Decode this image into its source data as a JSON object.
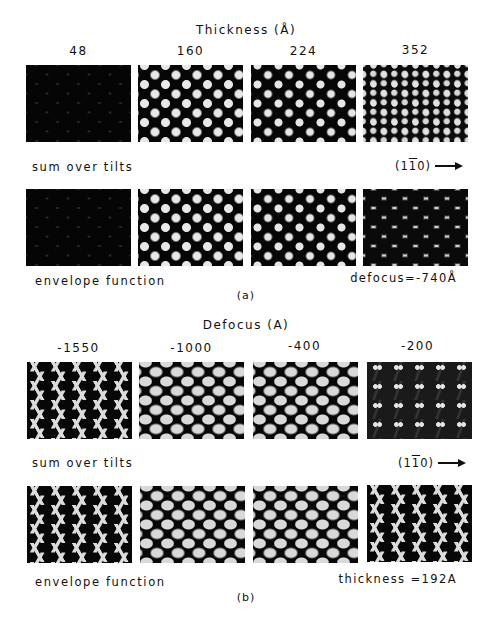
{
  "figure_a": {
    "title": "Thickness (Å)",
    "columns": [
      "48",
      "160",
      "224",
      "352"
    ],
    "row1_label": "sum over tilts",
    "row2_label": "envelope function",
    "orientation": {
      "prefix": "(1",
      "barred": "1",
      "suffix": "0)"
    },
    "parameter": "defocus=-740Å",
    "sublabel": "(a)",
    "row1_patterns": [
      "p-hexdark",
      "p-dots",
      "p-dots-small",
      "p-dense"
    ],
    "row2_patterns": [
      "p-hexdark",
      "p-dots",
      "p-dots-small",
      "p-hexmid"
    ]
  },
  "figure_b": {
    "title": "Defocus (A)",
    "columns": [
      "-1550",
      "-1000",
      "-400",
      "-200"
    ],
    "row1_label": "sum over tilts",
    "row2_label": "envelope function",
    "orientation": {
      "prefix": "(1",
      "barred": "1",
      "suffix": "0)"
    },
    "parameter": "thickness =192A",
    "sublabel": "(b)",
    "row1_patterns": [
      "p-zig",
      "p-blobs",
      "p-blobs",
      "p-pairs"
    ],
    "row2_patterns": [
      "p-zig",
      "p-blobs",
      "p-blobs",
      "p-zig"
    ]
  }
}
